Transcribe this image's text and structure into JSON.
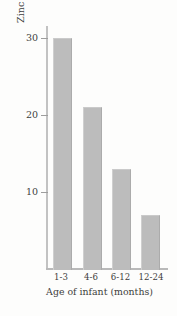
{
  "chart_data": {
    "type": "bar",
    "title": "",
    "subtitle": "",
    "categories": [
      "1-3",
      "4-6",
      "6-12",
      "12-24"
    ],
    "values": [
      30,
      21,
      13,
      7
    ],
    "series": [
      {
        "name": "Zinc intake",
        "values": [
          30,
          21,
          13,
          7
        ]
      }
    ],
    "xlabel": "Age of infant (months)",
    "ylabel": "Zinc intake (mg/day)",
    "ylim": [
      0,
      32
    ],
    "yticks": [
      10,
      20,
      30
    ],
    "ytick_labels": [
      "10",
      "20",
      "30"
    ],
    "xtick_labels": [
      "1-3",
      "4-6",
      "6-12",
      "12-24"
    ],
    "grid": false,
    "legend": false,
    "legend_position": "none",
    "bar_color": "#bcbcbc",
    "axis_color": "#b9b9b9",
    "text_color": "#3d3d3d",
    "background_color": "#fdfdfc"
  },
  "axes": {
    "y_tick_1": "10",
    "y_tick_2": "20",
    "y_tick_3": "30",
    "y_title": "Zinc intake (mg/day)",
    "x_title": "Age of infant (months)",
    "x_tick_1": "1-3",
    "x_tick_2": "4-6",
    "x_tick_3": "6-12",
    "x_tick_4": "12-24"
  }
}
